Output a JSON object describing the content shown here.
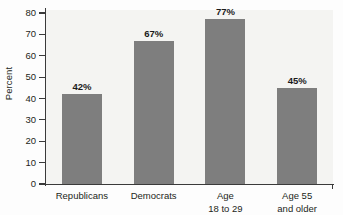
{
  "chart_data": {
    "type": "bar",
    "title": "",
    "xlabel": "",
    "ylabel": "Percent",
    "categories": [
      "Republicans",
      "Democrats",
      "Age 18 to 29",
      "Age 55 and older"
    ],
    "category_lines": [
      [
        "Republicans"
      ],
      [
        "Democrats"
      ],
      [
        "Age",
        "18 to 29"
      ],
      [
        "Age 55",
        "and older"
      ]
    ],
    "values": [
      42,
      67,
      77,
      45
    ],
    "value_labels": [
      "42%",
      "67%",
      "77%",
      "45%"
    ],
    "ylim": [
      0,
      80
    ],
    "yticks": [
      0,
      10,
      20,
      30,
      40,
      50,
      60,
      70,
      80
    ],
    "ytick_labels": [
      "0",
      "10",
      "20",
      "30",
      "40",
      "50",
      "60",
      "70",
      "80"
    ],
    "grid": false,
    "legend": null,
    "bar_color": "#7e7e7e",
    "plot_background": "#f4f4f2",
    "axis_color": "#3a3a3a"
  }
}
